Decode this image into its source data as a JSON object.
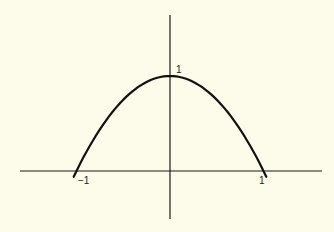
{
  "chart_data": {
    "type": "line",
    "title": "",
    "xlabel": "",
    "ylabel": "",
    "grid": false,
    "legend": null,
    "series": [
      {
        "name": "y = 1 - x^2",
        "x": [
          -1.03,
          -1.0,
          -0.75,
          -0.5,
          -0.25,
          0.0,
          0.25,
          0.5,
          0.75,
          1.0,
          1.03
        ],
        "y": [
          -0.12,
          0.0,
          0.44,
          0.75,
          0.94,
          1.0,
          0.94,
          0.75,
          0.44,
          0.0,
          -0.12
        ]
      }
    ],
    "tick_labels": {
      "x": [
        {
          "value": -1,
          "label": "−1"
        },
        {
          "value": 1,
          "label": "1"
        }
      ],
      "y": [
        {
          "value": 1,
          "label": "1"
        }
      ]
    },
    "xlim": [
      -1.6,
      1.6
    ],
    "ylim": [
      -0.5,
      1.6
    ]
  },
  "colors": {
    "background": "#fdfbe9",
    "axis": "#1a1a1a",
    "curve": "#111111"
  }
}
